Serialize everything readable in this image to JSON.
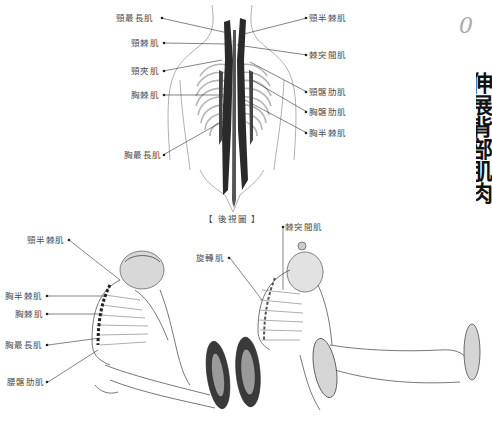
{
  "page": {
    "side_number": "0",
    "side_title_fragment": "伸展背部肌肉"
  },
  "back_view": {
    "caption": "【 後視圖 】",
    "left_labels": [
      {
        "text": "頸最長肌",
        "x": 116,
        "y": 14
      },
      {
        "text": "頸棘肌",
        "x": 131,
        "y": 38
      },
      {
        "text": "頸夾肌",
        "x": 131,
        "y": 66
      },
      {
        "text": "胸棘肌",
        "x": 131,
        "y": 90
      },
      {
        "text": "胸最長肌",
        "x": 124,
        "y": 151
      }
    ],
    "right_labels": [
      {
        "text": "頸半棘肌",
        "x": 309,
        "y": 14
      },
      {
        "text": "棘突間肌",
        "x": 309,
        "y": 51
      },
      {
        "text": "頸髂肋肌",
        "x": 309,
        "y": 88
      },
      {
        "text": "胸髂肋肌",
        "x": 309,
        "y": 108
      },
      {
        "text": "胸半棘肌",
        "x": 309,
        "y": 128
      }
    ]
  },
  "side_view_left": {
    "labels": [
      {
        "text": "頸半棘肌",
        "x": 27,
        "y": 235
      },
      {
        "text": "胸半棘肌",
        "x": 5,
        "y": 291
      },
      {
        "text": "胸棘肌",
        "x": 15,
        "y": 309
      },
      {
        "text": "胸最長肌",
        "x": 5,
        "y": 340
      },
      {
        "text": "腰髂肋肌",
        "x": 7,
        "y": 377
      }
    ]
  },
  "side_view_right": {
    "labels": [
      {
        "text": "棘突間肌",
        "x": 285,
        "y": 222
      },
      {
        "text": "旋轉肌",
        "x": 196,
        "y": 253
      }
    ]
  },
  "colors": {
    "label_text": "#4a4a4a",
    "leader_line": "#333333",
    "muscle_dark": "#2a2a2a",
    "sketch_gray": "#9a9a9a",
    "side_number": "#aaaaaa",
    "side_title": "#111111"
  }
}
